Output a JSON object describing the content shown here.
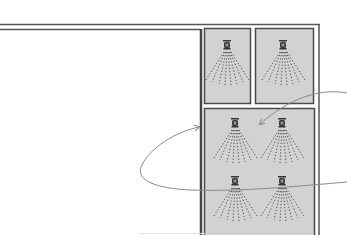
{
  "diagram": {
    "title": "",
    "colors": {
      "background": "#ffffff",
      "frame": "#555555",
      "zone_fill": "#d2d2d2",
      "zone_border": "#4a4a4a",
      "nozzle": "#3a3a3a",
      "spray": "#4a4a4a",
      "curve": "#8a8a8a"
    },
    "zones": [
      {
        "id": "zone-top-left",
        "nozzles": 1
      },
      {
        "id": "zone-top-right",
        "nozzles": 1
      },
      {
        "id": "zone-bottom",
        "nozzles": 4
      }
    ],
    "annotations": [
      {
        "type": "arrow-curve",
        "from": "right-edge",
        "to": "zone-bottom"
      },
      {
        "type": "loop-curve",
        "from": "right-edge",
        "to": "frame-divider"
      }
    ]
  }
}
